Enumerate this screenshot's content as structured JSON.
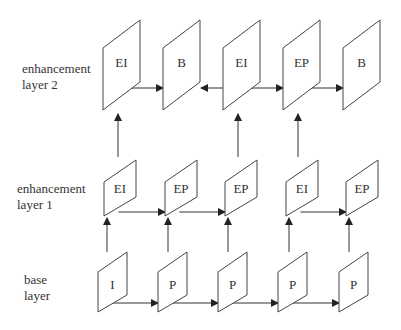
{
  "layers": [
    {
      "id": "enhancement2",
      "label_line1": "enhancement",
      "label_line2": "layer 2",
      "frames": [
        "EI",
        "B",
        "EI",
        "EP",
        "B"
      ]
    },
    {
      "id": "enhancement1",
      "label_line1": "enhancement",
      "label_line2": "layer 1",
      "frames": [
        "EI",
        "EP",
        "EP",
        "EI",
        "EP"
      ]
    },
    {
      "id": "base",
      "label_line1": "base",
      "label_line2": "layer",
      "frames": [
        "I",
        "P",
        "P",
        "P",
        "P"
      ]
    }
  ],
  "arrows": {
    "enhancement2_horizontal": [
      {
        "from": 0,
        "to": 1
      },
      {
        "from": 2,
        "to": 1
      },
      {
        "from": 2,
        "to": 3
      },
      {
        "from": 3,
        "to": 4
      }
    ],
    "enhancement1_horizontal": [
      {
        "from": 0,
        "to": 1
      },
      {
        "from": 1,
        "to": 2
      },
      {
        "from": 3,
        "to": 4
      }
    ],
    "base_horizontal": [
      {
        "from": 0,
        "to": 1
      },
      {
        "from": 1,
        "to": 2
      },
      {
        "from": 2,
        "to": 3
      },
      {
        "from": 3,
        "to": 4
      }
    ],
    "vertical_layer1_to_layer2": [
      0,
      2,
      3
    ],
    "vertical_base_to_layer1": [
      0,
      1,
      2,
      3,
      4
    ]
  },
  "colors": {
    "stroke": "#333333",
    "text": "#333333",
    "background": "#ffffff"
  }
}
